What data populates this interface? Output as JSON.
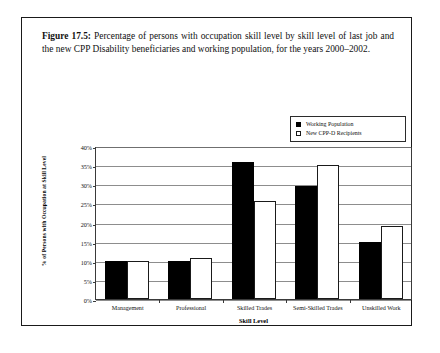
{
  "figure": {
    "label": "Figure 17.5:",
    "caption": "Percentage of persons with occupation skill level by skill level of last job and the new CPP Disability beneficiaries and working population, for the years 2000–2002."
  },
  "chart_data": {
    "type": "bar",
    "title": "",
    "xlabel": "Skill Level",
    "ylabel": "% of Persons with Occupation at Skill Level",
    "categories": [
      "Management",
      "Professional",
      "Skilled Trades",
      "Semi-Skilled Trades",
      "Unskilled Work"
    ],
    "series": [
      {
        "name": "Working Population",
        "color": "#000000",
        "values": [
          10,
          10,
          35.7,
          29.5,
          15
        ]
      },
      {
        "name": "New CPP-D Recipients",
        "color": "#ffffff",
        "values": [
          10,
          10.7,
          25.5,
          35,
          19
        ]
      }
    ],
    "ylim": [
      0,
      40
    ],
    "ytick_values": [
      0,
      5,
      10,
      15,
      20,
      25,
      30,
      35,
      40
    ],
    "ytick_labels": [
      "0%",
      "5%",
      "10%",
      "15%",
      "20%",
      "25%",
      "30%",
      "35%",
      "40%"
    ],
    "grid": true,
    "legend_position": "top-right"
  },
  "colors": {
    "frame": "#1a1a1a",
    "gridline": "#8d8d8d",
    "axis": "#3a3a3a",
    "background": "#ffffff"
  }
}
